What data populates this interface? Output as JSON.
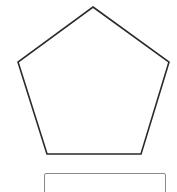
{
  "shape": {
    "type": "pentagon",
    "stroke_color": "#2a2a2a",
    "fill_color": "#ffffff",
    "points": "93,7 169,62 141,154 47,154 18,62"
  },
  "answer_input": {
    "value": "",
    "placeholder": ""
  }
}
